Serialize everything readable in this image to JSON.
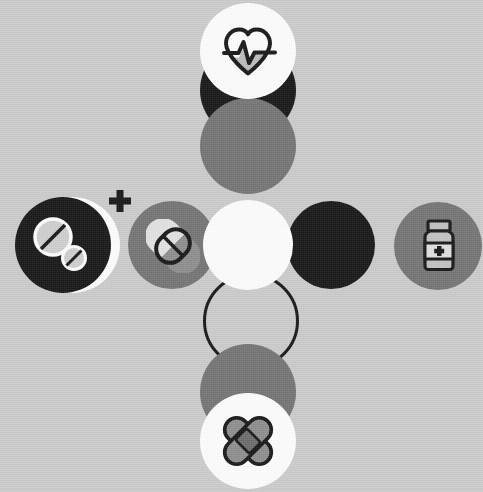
{
  "canvas": {
    "width": 483,
    "height": 492,
    "background_color": "#cccccc",
    "title": "Medical and pharmacy icon circle composition"
  },
  "palette": {
    "background": "#cccccc",
    "white": "#fdfdfd",
    "black": "#1a1a1a",
    "gray": "#767676",
    "dark_gray": "#6e6e6e",
    "icon_light": "#d9d9d9",
    "icon_mid": "#9a9a9a",
    "icon_dark": "#6b6b6b",
    "outline": "#1a1a1a"
  },
  "watermark": {
    "text": "",
    "visible": false
  },
  "shapes": {
    "backdrops": [
      {
        "name": "top-black-backdrop-circle",
        "color_key": "black",
        "cx": 248,
        "cy": 90,
        "r": 48
      },
      {
        "name": "top-gray-backdrop-circle",
        "color_key": "gray",
        "cx": 248,
        "cy": 146,
        "r": 48
      },
      {
        "name": "left-white-backdrop-circle",
        "color_key": "white",
        "cx": 72,
        "cy": 245,
        "r": 48
      },
      {
        "name": "bottom-gray-backdrop-circle",
        "color_key": "gray",
        "cx": 248,
        "cy": 392,
        "r": 48
      }
    ],
    "ring": {
      "name": "outline-ring-circle",
      "cx": 248,
      "cy": 318,
      "r": 45,
      "stroke_color_key": "black",
      "stroke_width": 3
    },
    "plus_mark": {
      "name": "plus-mark",
      "cx": 120,
      "cy": 201,
      "size": 22,
      "thickness": 7,
      "color_key": "black"
    }
  },
  "nodes": [
    {
      "id": "heart-rate",
      "label": "Heart Rate",
      "icon": "heart-pulse-icon",
      "position": "top",
      "cx": 248,
      "cy": 51,
      "r": 48,
      "fill_color_key": "white",
      "has_icon": true
    },
    {
      "id": "tablets",
      "label": "Tablets",
      "icon": "tablet-pills-icon",
      "position": "left-outer",
      "cx": 63,
      "cy": 245,
      "r": 48,
      "fill_color_key": "black",
      "has_icon": true
    },
    {
      "id": "capsule",
      "label": "Capsule",
      "icon": "capsule-pill-icon",
      "position": "left-inner",
      "cx": 172,
      "cy": 245,
      "r": 44,
      "fill_color_key": "gray",
      "has_icon": true
    },
    {
      "id": "center",
      "label": "Center",
      "icon": "none",
      "position": "center",
      "cx": 248,
      "cy": 245,
      "r": 45,
      "fill_color_key": "white",
      "has_icon": false
    },
    {
      "id": "right-inner",
      "label": "Blank",
      "icon": "none",
      "position": "right-inner",
      "cx": 331,
      "cy": 245,
      "r": 44,
      "fill_color_key": "black",
      "has_icon": false
    },
    {
      "id": "medicine-bottle",
      "label": "Medicine Bottle",
      "icon": "medicine-bottle-icon",
      "position": "right-outer",
      "cx": 438,
      "cy": 246,
      "r": 44,
      "fill_color_key": "gray",
      "has_icon": true
    },
    {
      "id": "bandage",
      "label": "Bandage",
      "icon": "crossed-bandage-icon",
      "position": "bottom",
      "cx": 248,
      "cy": 441,
      "r": 48,
      "fill_color_key": "white",
      "has_icon": true
    }
  ]
}
